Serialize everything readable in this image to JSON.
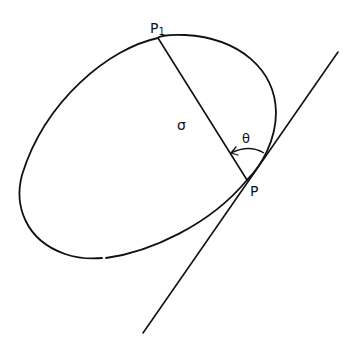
{
  "diagram": {
    "title": "",
    "colors": {
      "stroke": "#111111",
      "background": "#ffffff"
    },
    "labels": {
      "p1": {
        "main": "P",
        "sub": "1"
      },
      "p": "P",
      "sigma": "σ",
      "theta": "θ"
    },
    "elements": {
      "curve": "closed oval curve through P1 and P",
      "chord": "line segment P1–P of length σ",
      "tangent": "tangent line to curve at P",
      "angle": "angle θ between chord and tangent at P, arc with arrow"
    }
  }
}
